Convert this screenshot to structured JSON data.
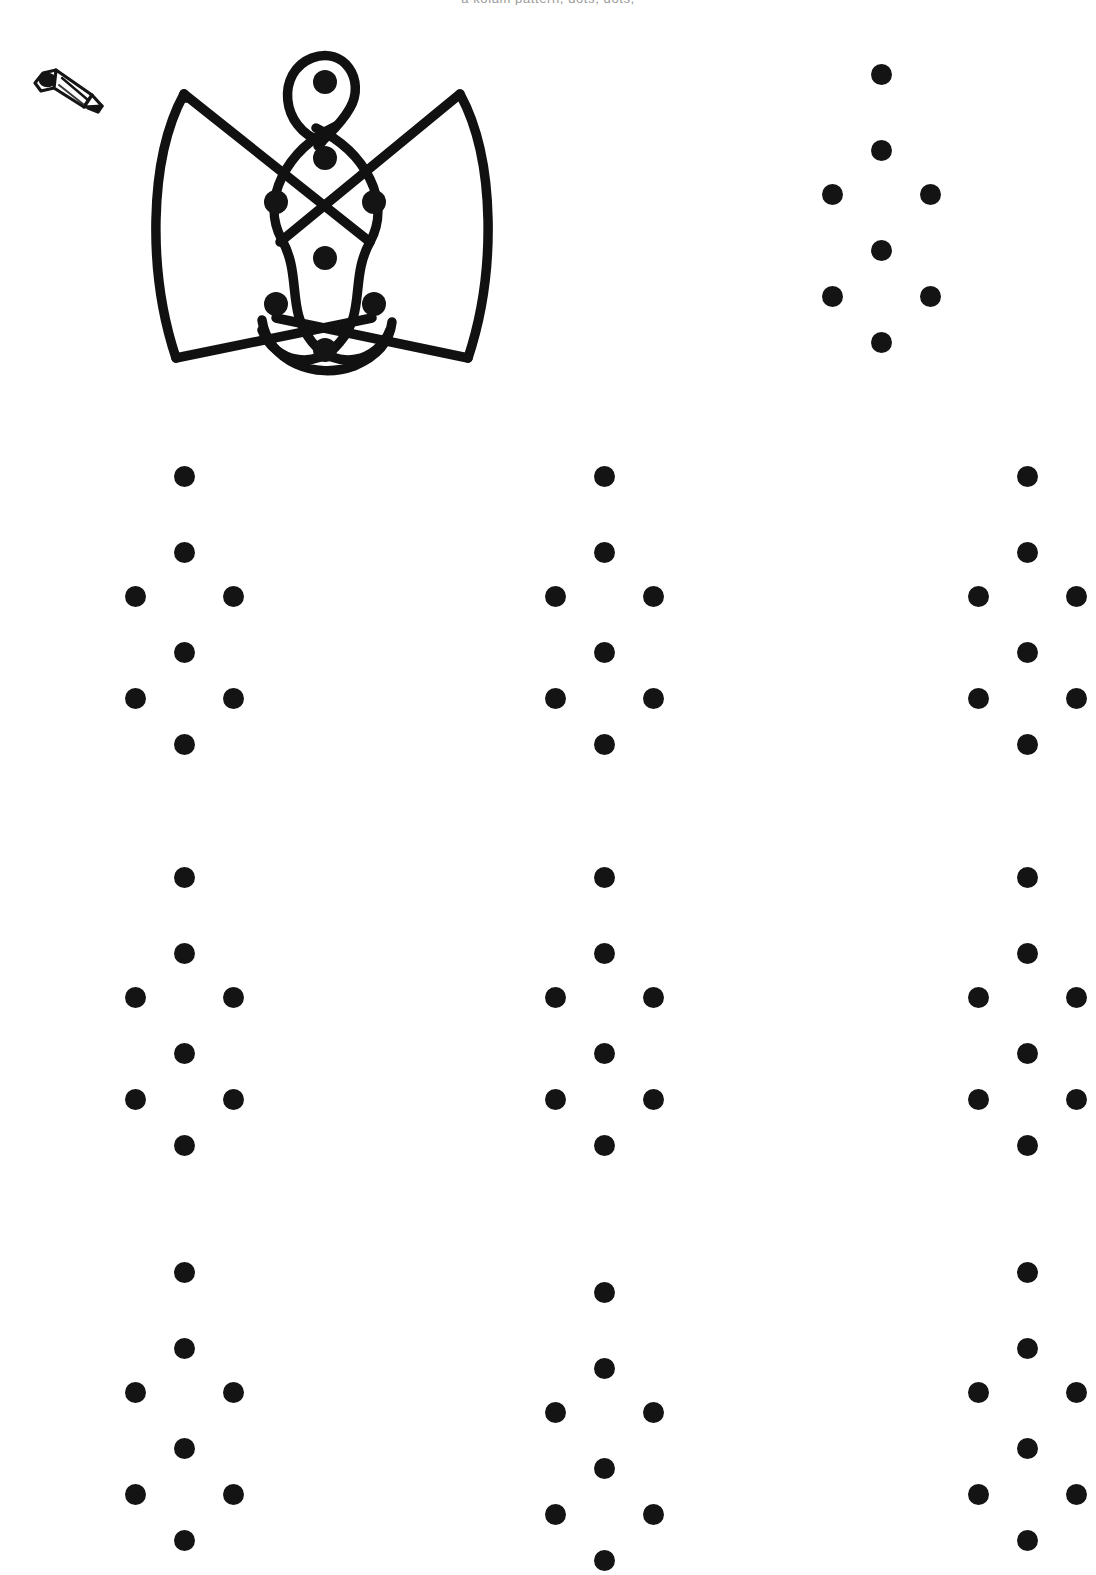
{
  "document": {
    "type": "kolam-practice-worksheet",
    "title_clipped": "a kolam pattern, dots, dots,",
    "ink_color": "#141414",
    "paper_color": "#ffffff"
  },
  "icons": {
    "pencil": "pencil-icon"
  },
  "kolam_design": {
    "name": "butterfly-knot-kolam",
    "stroke_color": "#111111",
    "stroke_width": 9,
    "dot_count": 8,
    "description": "Two large curved wings left and right, a looped teardrop at the top, a double sinuous loop down the centre and two straight diagonals crossing in an X"
  },
  "dot_pattern": {
    "name": "8-dot-kolam-grid",
    "dot_count": 8,
    "dot_radius": 11,
    "points": [
      {
        "id": "top",
        "x": 76,
        "y": 14
      },
      {
        "id": "upper-centre",
        "x": 76,
        "y": 90
      },
      {
        "id": "upper-left",
        "x": 27,
        "y": 134
      },
      {
        "id": "upper-right",
        "x": 125,
        "y": 134
      },
      {
        "id": "lower-centre",
        "x": 76,
        "y": 190
      },
      {
        "id": "lower-left",
        "x": 27,
        "y": 236
      },
      {
        "id": "lower-right",
        "x": 125,
        "y": 236
      },
      {
        "id": "bottom",
        "x": 76,
        "y": 282
      }
    ]
  },
  "grids": [
    {
      "id": "reference-grid",
      "label": "reference",
      "left": 805,
      "top": 60,
      "clipped": false
    },
    {
      "id": "practice-grid-1",
      "label": "practice 1",
      "left": 108,
      "top": 462,
      "clipped": false
    },
    {
      "id": "practice-grid-2",
      "label": "practice 2",
      "left": 528,
      "top": 462,
      "clipped": false
    },
    {
      "id": "practice-grid-3",
      "label": "practice 3",
      "left": 951,
      "top": 462,
      "clipped": true
    },
    {
      "id": "practice-grid-4",
      "label": "practice 4",
      "left": 108,
      "top": 863,
      "clipped": false
    },
    {
      "id": "practice-grid-5",
      "label": "practice 5",
      "left": 528,
      "top": 863,
      "clipped": false
    },
    {
      "id": "practice-grid-6",
      "label": "practice 6",
      "left": 951,
      "top": 863,
      "clipped": true
    },
    {
      "id": "practice-grid-7",
      "label": "practice 7",
      "left": 108,
      "top": 1258,
      "clipped": false
    },
    {
      "id": "practice-grid-8",
      "label": "practice 8",
      "left": 528,
      "top": 1278,
      "clipped": false
    },
    {
      "id": "practice-grid-9",
      "label": "practice 9",
      "left": 951,
      "top": 1258,
      "clipped": true
    }
  ]
}
